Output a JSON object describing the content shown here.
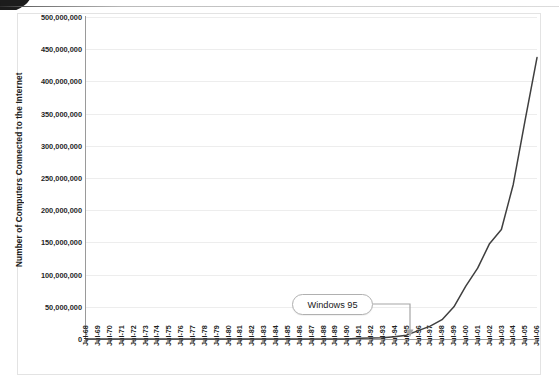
{
  "chart_data": {
    "type": "line",
    "title": "",
    "xlabel": "",
    "ylabel": "Number of Computers Connected to the Internet",
    "ylim": [
      0,
      500000000
    ],
    "grid": true,
    "legend": "none",
    "line_color": "#3f3f3f",
    "ytick_labels": [
      "500,000,000",
      "450,000,000",
      "400,000,000",
      "350,000,000",
      "300,000,000",
      "250,000,000",
      "200,000,000",
      "150,000,000",
      "100,000,000",
      "50,000,000",
      "0"
    ],
    "ytick_values": [
      500000000,
      450000000,
      400000000,
      350000000,
      300000000,
      250000000,
      200000000,
      150000000,
      100000000,
      50000000,
      0
    ],
    "categories": [
      "Jul-68",
      "Jul-69",
      "Jul-70",
      "Jul-71",
      "Jul-72",
      "Jul-73",
      "Jul-74",
      "Jul-75",
      "Jul-76",
      "Jul-77",
      "Jul-78",
      "Jul-79",
      "Jul-80",
      "Jul-81",
      "Jul-82",
      "Jul-83",
      "Jul-84",
      "Jul-85",
      "Jul-86",
      "Jul-87",
      "Jul-88",
      "Jul-89",
      "Jul-90",
      "Jul-91",
      "Jul-92",
      "Jul-93",
      "Jul-94",
      "Jul-95",
      "Jul-96",
      "Jul-97",
      "Jul-98",
      "Jul-99",
      "Jul-00",
      "Jul-01",
      "Jul-02",
      "Jul-03",
      "Jul-04",
      "Jul-05",
      "Jul-06"
    ],
    "values": [
      0,
      0,
      0,
      0,
      0,
      0,
      0,
      0,
      0,
      0,
      0,
      0,
      0,
      0,
      0,
      0,
      0,
      0,
      0,
      0,
      0,
      0,
      0,
      1000000,
      1500000,
      2000000,
      3500000,
      6000000,
      13000000,
      20000000,
      30000000,
      50000000,
      82000000,
      110000000,
      148000000,
      170000000,
      240000000,
      340000000,
      437000000
    ],
    "annotations": [
      {
        "label": "Windows 95",
        "points_to_category": "Jul-95",
        "arrow": "down"
      }
    ]
  },
  "annotation": {
    "windows95_label": "Windows 95"
  }
}
